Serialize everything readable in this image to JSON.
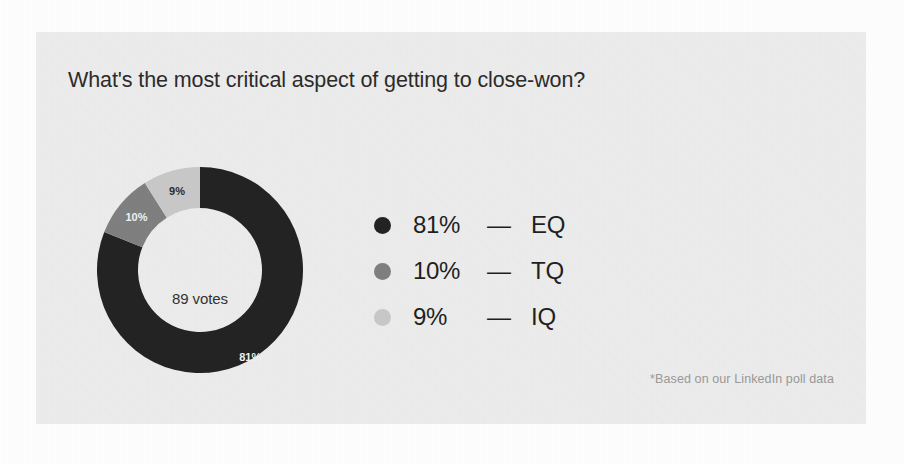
{
  "card": {
    "title": "What's the most critical aspect of getting to close-won?",
    "footnote": "*Based on our LinkedIn poll data",
    "background_color": "#eeeeee",
    "page_background_color": "#ffffff"
  },
  "chart_data": {
    "type": "pie",
    "variant": "donut",
    "title": "What's the most critical aspect of getting to close-won?",
    "center_label": "89 votes",
    "total_votes": 89,
    "unit": "%",
    "legend_position": "right",
    "start_angle_deg": 0,
    "direction": "clockwise",
    "categories": [
      "EQ",
      "TQ",
      "IQ"
    ],
    "values": [
      81,
      10,
      9
    ],
    "slices": [
      {
        "name": "EQ",
        "value": 81,
        "percent_label": "81%",
        "color": "#232323",
        "label_color": "#f2f2f2",
        "legend_dot_color": "#232323"
      },
      {
        "name": "TQ",
        "value": 10,
        "percent_label": "10%",
        "color": "#808080",
        "label_color": "#f2f2f2",
        "legend_dot_color": "#808080"
      },
      {
        "name": "IQ",
        "value": 9,
        "percent_label": "9%",
        "color": "#c9c9c9",
        "label_color": "#2b2b2b",
        "legend_dot_color": "#c9c9c9"
      }
    ],
    "annotations": [
      "*Based on our LinkedIn poll data"
    ]
  },
  "legend": {
    "separator": "—",
    "rows": [
      {
        "percent": "81%",
        "dash": "—",
        "name": "EQ",
        "color": "#232323"
      },
      {
        "percent": "10%",
        "dash": "—",
        "name": "TQ",
        "color": "#808080"
      },
      {
        "percent": "9%",
        "dash": "—",
        "name": "IQ",
        "color": "#c9c9c9"
      }
    ]
  }
}
